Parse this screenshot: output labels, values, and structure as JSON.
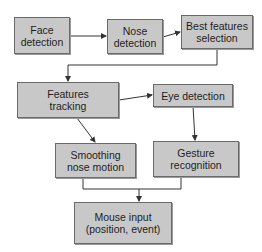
{
  "diagram": {
    "nodes": [
      {
        "id": "face",
        "label": "Face\ndetection"
      },
      {
        "id": "nose",
        "label": "Nose\ndetection"
      },
      {
        "id": "best",
        "label": "Best features\nselection"
      },
      {
        "id": "track",
        "label": "Features\ntracking"
      },
      {
        "id": "eye",
        "label": "Eye detection"
      },
      {
        "id": "smooth",
        "label": "Smoothing\nnose motion"
      },
      {
        "id": "gesture",
        "label": "Gesture\nrecognition"
      },
      {
        "id": "mouse",
        "label": "Mouse input\n(position, event)"
      }
    ],
    "edges": [
      {
        "from": "face",
        "to": "nose"
      },
      {
        "from": "nose",
        "to": "best"
      },
      {
        "from": "best",
        "to": "track"
      },
      {
        "from": "track",
        "to": "eye"
      },
      {
        "from": "track",
        "to": "smooth"
      },
      {
        "from": "eye",
        "to": "gesture"
      },
      {
        "from": "smooth",
        "to": "mouse"
      },
      {
        "from": "gesture",
        "to": "mouse"
      }
    ],
    "colors": {
      "box_fill": "#c8c8c8",
      "box_border": "#6a6a6a",
      "line": "#333333"
    }
  }
}
